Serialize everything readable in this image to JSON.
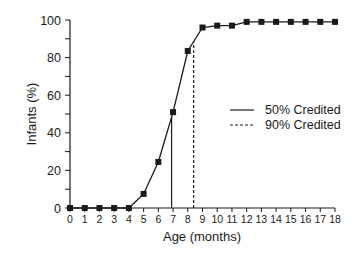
{
  "chart_data": {
    "type": "line",
    "title": "",
    "xlabel": "Age (months)",
    "ylabel": "Infants (%)",
    "x": [
      0,
      1,
      2,
      3,
      4,
      5,
      6,
      7,
      8,
      9,
      10,
      11,
      12,
      13,
      14,
      15,
      16,
      17,
      18
    ],
    "series": [
      {
        "name": "Infants crediting",
        "values": [
          0,
          0,
          0,
          0,
          0,
          7.5,
          24.5,
          51,
          83.5,
          96,
          97,
          97,
          99,
          99,
          99,
          99,
          99,
          99,
          99
        ],
        "marker": "square",
        "color": "#1a1a1a"
      }
    ],
    "reference_lines": [
      {
        "name": "50% Credited",
        "x": 6.9,
        "style": "solid"
      },
      {
        "name": "90% Credited",
        "x": 8.4,
        "style": "dashed"
      }
    ],
    "xlim": [
      0,
      18
    ],
    "ylim": [
      0,
      100
    ],
    "xticks": [
      "0",
      "1",
      "2",
      "3",
      "4",
      "5",
      "6",
      "7",
      "8",
      "9",
      "10",
      "11",
      "12",
      "13",
      "14",
      "15",
      "16",
      "17",
      "18"
    ],
    "yticks": [
      "0",
      "20",
      "40",
      "60",
      "80",
      "100"
    ],
    "grid": false,
    "legend": {
      "position": "right-middle",
      "entries": [
        "50% Credited",
        "90% Credited"
      ]
    }
  },
  "legend": {
    "solid_label": "50% Credited",
    "dashed_label": "90% Credited"
  },
  "axes": {
    "xlabel": "Age (months)",
    "ylabel": "Infants (%)"
  }
}
